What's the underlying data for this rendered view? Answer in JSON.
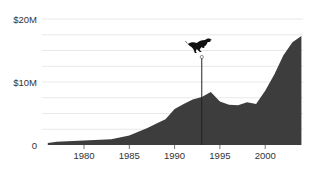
{
  "chart_data": {
    "type": "area",
    "title": "",
    "xlabel": "",
    "ylabel": "",
    "x": [
      1976,
      1977,
      1980,
      1983,
      1985,
      1987,
      1988,
      1989,
      1990,
      1991,
      1992,
      1993,
      1994,
      1995,
      1996,
      1997,
      1998,
      1999,
      2000,
      2001,
      2002,
      2003,
      2004
    ],
    "series": [
      {
        "name": "value",
        "unit": "$M",
        "values": [
          0.3,
          0.5,
          0.7,
          0.9,
          1.5,
          2.7,
          3.4,
          4.1,
          5.7,
          6.5,
          7.2,
          7.6,
          8.4,
          6.9,
          6.4,
          6.3,
          6.8,
          6.5,
          8.6,
          11.2,
          14.2,
          16.3,
          17.3
        ]
      }
    ],
    "xlim": [
      1976,
      2004
    ],
    "ylim": [
      0,
      20
    ],
    "y_ticks": [
      {
        "value": 0,
        "label": "0"
      },
      {
        "value": 10,
        "label": "$10M"
      },
      {
        "value": 20,
        "label": "$20M"
      }
    ],
    "x_ticks": [
      {
        "value": 1980,
        "label": "1980"
      },
      {
        "value": 1985,
        "label": "1985"
      },
      {
        "value": 1990,
        "label": "1990"
      },
      {
        "value": 1995,
        "label": "1995"
      },
      {
        "value": 2000,
        "label": "2000"
      }
    ],
    "grid": true,
    "grid_step": 2.5,
    "annotations": [
      {
        "type": "vertical-line",
        "x": 1993,
        "icon": "dinosaur-icon"
      }
    ],
    "colors": {
      "area": "#3d3d3d",
      "grid": "#e8e8e8",
      "marker_line": "#222222",
      "tick_text": "#333333"
    }
  }
}
